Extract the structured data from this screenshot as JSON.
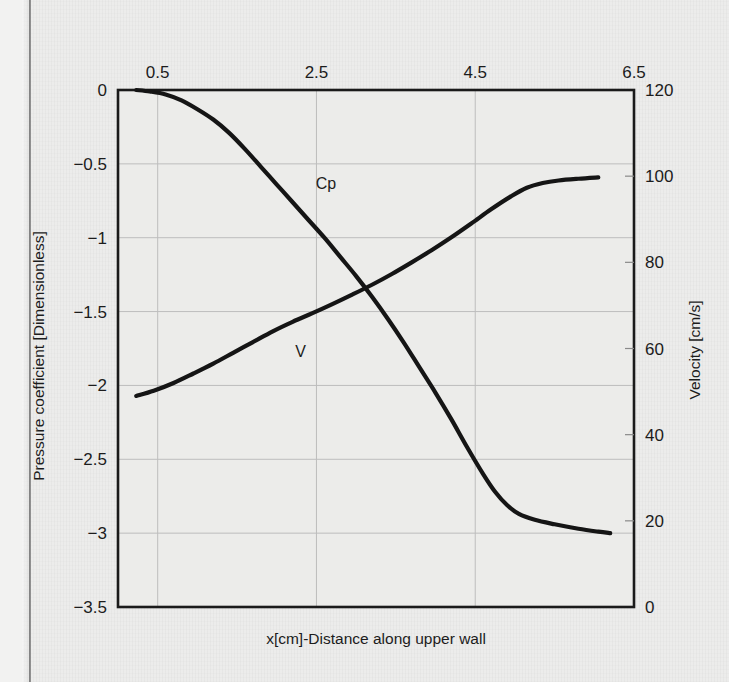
{
  "chart_data": {
    "type": "line",
    "title": "",
    "subtitle": "",
    "xlabel": "x[cm]-Distance along upper wall",
    "ylabel": "Pressure coefficient [Dimensionless]",
    "y2label": "Velocity [cm/s]",
    "x_axis_position": "top",
    "xlim": [
      0.0,
      6.5
    ],
    "xticks": [
      "0.5",
      "2.5",
      "4.5",
      "6.5"
    ],
    "xtick_values": [
      0.5,
      2.5,
      4.5,
      6.5
    ],
    "ylim": [
      -3.5,
      0
    ],
    "yticks": [
      "0",
      "−0.5",
      "−1",
      "−1.5",
      "−2",
      "−2.5",
      "−3",
      "−3.5"
    ],
    "ytick_values": [
      0,
      -0.5,
      -1,
      -1.5,
      -2,
      -2.5,
      -3,
      -3.5
    ],
    "y2lim": [
      0,
      120
    ],
    "y2ticks": [
      "120",
      "100",
      "80",
      "60",
      "40",
      "20",
      "0"
    ],
    "y2tick_values": [
      120,
      100,
      80,
      60,
      40,
      20,
      0
    ],
    "grid": true,
    "legend_position": "inline-annotation",
    "series": [
      {
        "name": "Cp",
        "axis": "left",
        "label_text": "Cp",
        "label_x": 2.62,
        "label_y": -0.67,
        "color": "#151515",
        "points": [
          [
            0.23,
            0.0
          ],
          [
            0.4,
            -0.01
          ],
          [
            0.6,
            -0.03
          ],
          [
            0.8,
            -0.07
          ],
          [
            1.0,
            -0.13
          ],
          [
            1.2,
            -0.2
          ],
          [
            1.4,
            -0.29
          ],
          [
            1.6,
            -0.4
          ],
          [
            1.8,
            -0.52
          ],
          [
            2.0,
            -0.64
          ],
          [
            2.2,
            -0.76
          ],
          [
            2.4,
            -0.88
          ],
          [
            2.6,
            -1.0
          ],
          [
            2.8,
            -1.13
          ],
          [
            3.0,
            -1.26
          ],
          [
            3.2,
            -1.4
          ],
          [
            3.4,
            -1.55
          ],
          [
            3.6,
            -1.71
          ],
          [
            3.8,
            -1.88
          ],
          [
            4.0,
            -2.05
          ],
          [
            4.2,
            -2.23
          ],
          [
            4.4,
            -2.42
          ],
          [
            4.6,
            -2.6
          ],
          [
            4.75,
            -2.72
          ],
          [
            4.9,
            -2.81
          ],
          [
            5.05,
            -2.87
          ],
          [
            5.25,
            -2.91
          ],
          [
            5.5,
            -2.94
          ],
          [
            5.8,
            -2.97
          ],
          [
            6.05,
            -2.99
          ],
          [
            6.2,
            -3.0
          ]
        ]
      },
      {
        "name": "V",
        "axis": "right",
        "label_text": "V",
        "label_x": 2.3,
        "label_y": 58.0,
        "color": "#151515",
        "points": [
          [
            0.23,
            49.0
          ],
          [
            0.45,
            50.2
          ],
          [
            0.7,
            52.0
          ],
          [
            0.95,
            54.2
          ],
          [
            1.2,
            56.5
          ],
          [
            1.45,
            59.0
          ],
          [
            1.7,
            61.5
          ],
          [
            1.95,
            64.0
          ],
          [
            2.2,
            66.2
          ],
          [
            2.45,
            68.2
          ],
          [
            2.7,
            70.3
          ],
          [
            2.95,
            72.5
          ],
          [
            3.2,
            74.8
          ],
          [
            3.45,
            77.3
          ],
          [
            3.7,
            80.0
          ],
          [
            3.95,
            82.8
          ],
          [
            4.2,
            85.8
          ],
          [
            4.45,
            89.0
          ],
          [
            4.7,
            92.3
          ],
          [
            4.95,
            95.3
          ],
          [
            5.15,
            97.3
          ],
          [
            5.35,
            98.4
          ],
          [
            5.55,
            99.0
          ],
          [
            5.8,
            99.4
          ],
          [
            6.05,
            99.7
          ]
        ]
      }
    ]
  },
  "plot": {
    "frame_color": "#1a1a1a",
    "grid_color": "#bdbdbd",
    "background_color": "#ececea"
  }
}
